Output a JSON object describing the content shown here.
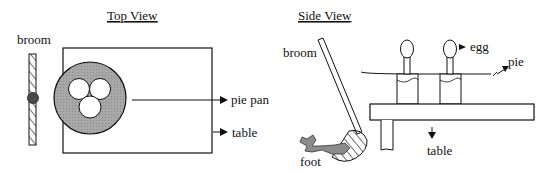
{
  "top_view": {
    "title": "Top View",
    "labels": {
      "broom": "broom",
      "pie_pan": "pie pan",
      "table": "table"
    }
  },
  "side_view": {
    "title": "Side View",
    "labels": {
      "broom": "broom",
      "egg": "egg",
      "pie": "pie",
      "foot": "foot",
      "table": "table"
    }
  },
  "colors": {
    "line": "#111111",
    "pan_fill": "#9a9a9a",
    "foot_fill": "#8c8c8c",
    "broom_dot": "#555555"
  }
}
